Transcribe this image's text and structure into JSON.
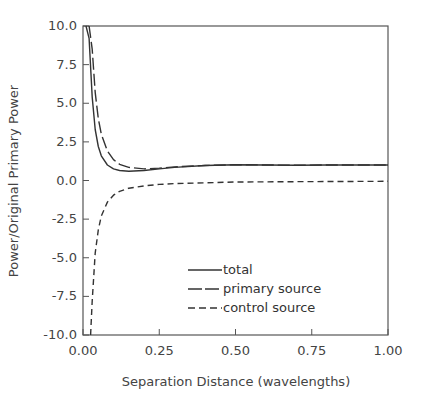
{
  "chart_data": {
    "type": "line",
    "title": "",
    "xlabel": "Separation Distance (wavelengths)",
    "ylabel": "Power/Original Primary Power",
    "xlim": [
      0.0,
      1.0
    ],
    "ylim": [
      -10.0,
      10.0
    ],
    "xticks": [
      "0.00",
      "0.25",
      "0.50",
      "0.75",
      "1.00"
    ],
    "yticks": [
      "10.0",
      "7.5",
      "5.0",
      "2.5",
      "0.0",
      "-2.5",
      "-5.0",
      "-7.5",
      "-10.0"
    ],
    "grid": false,
    "legend_position": "lower center inside",
    "series": [
      {
        "name": "total",
        "style": "solid",
        "x": [
          0.01,
          0.02,
          0.03,
          0.04,
          0.05,
          0.06,
          0.08,
          0.1,
          0.12,
          0.15,
          0.2,
          0.25,
          0.3,
          0.4,
          0.5,
          0.6,
          0.7,
          0.8,
          0.9,
          1.0
        ],
        "y": [
          10.0,
          9.2,
          5.4,
          3.3,
          2.2,
          1.6,
          1.0,
          0.75,
          0.65,
          0.6,
          0.65,
          0.75,
          0.85,
          0.97,
          1.02,
          1.0,
          0.99,
          1.0,
          1.0,
          1.0
        ]
      },
      {
        "name": "primary source",
        "style": "long-dash",
        "x": [
          0.02,
          0.03,
          0.04,
          0.05,
          0.06,
          0.08,
          0.1,
          0.12,
          0.15,
          0.2,
          0.25,
          0.3,
          0.4,
          0.5,
          0.6,
          0.7,
          0.8,
          0.9,
          1.0
        ],
        "y": [
          10.0,
          8.5,
          5.7,
          4.0,
          3.0,
          1.9,
          1.35,
          1.05,
          0.85,
          0.75,
          0.8,
          0.88,
          0.97,
          1.02,
          1.0,
          0.99,
          1.0,
          1.0,
          1.0
        ]
      },
      {
        "name": "control source",
        "style": "short-dash",
        "x": [
          0.025,
          0.03,
          0.04,
          0.05,
          0.06,
          0.08,
          0.1,
          0.12,
          0.15,
          0.2,
          0.25,
          0.3,
          0.4,
          0.5,
          0.75,
          1.0
        ],
        "y": [
          -10.0,
          -7.8,
          -4.7,
          -3.2,
          -2.3,
          -1.4,
          -0.95,
          -0.7,
          -0.5,
          -0.35,
          -0.25,
          -0.2,
          -0.15,
          -0.1,
          -0.07,
          -0.05
        ]
      }
    ]
  },
  "legend": {
    "items": [
      {
        "label": "total",
        "style": "solid"
      },
      {
        "label": "primary source",
        "style": "long-dash"
      },
      {
        "label": "control source",
        "style": "short-dash"
      }
    ]
  },
  "colors": {
    "line": "#333333",
    "axis": "#555555",
    "text": "#444444"
  }
}
